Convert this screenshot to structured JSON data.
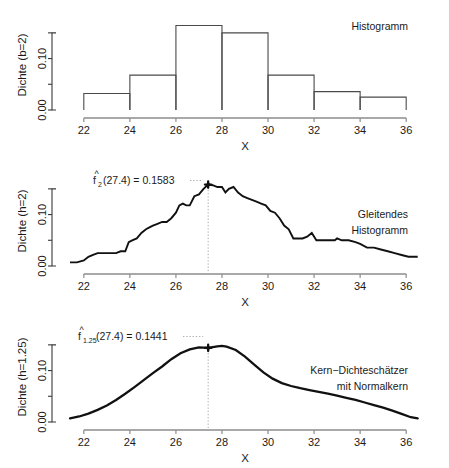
{
  "figure": {
    "background": "#ffffff",
    "ink": "#111111",
    "axis_color": "#3a3a3a",
    "guide_color": "#9a9a9a"
  },
  "chart_data": [
    {
      "id": "histogramm",
      "type": "bar",
      "title": "Histogramm",
      "xlabel": "X",
      "ylabel": "Dichte (b=2)",
      "xlim": [
        21.4,
        36.6
      ],
      "ylim": [
        0.0,
        0.175
      ],
      "xticks": [
        22,
        24,
        26,
        28,
        30,
        32,
        34,
        36
      ],
      "xticklabels": [
        "22",
        "24",
        "26",
        "28",
        "30",
        "32",
        "34",
        "36"
      ],
      "yticks": [
        0.0,
        0.05,
        0.1,
        0.15
      ],
      "yticklabels": [
        "0.00",
        "",
        "0.10",
        ""
      ],
      "grid": false,
      "binwidth": 2,
      "bin_edges": [
        22,
        24,
        26,
        28,
        30,
        32,
        34,
        36
      ],
      "categories": [
        "22-24",
        "24-26",
        "26-28",
        "28-30",
        "30-32",
        "32-34",
        "34-36"
      ],
      "values": [
        0.0321,
        0.0679,
        0.1643,
        0.15,
        0.0679,
        0.0357,
        0.025
      ]
    },
    {
      "id": "gleitendes-histogramm",
      "type": "line",
      "title_line1": "Gleitendes",
      "title_line2": "Histogramm",
      "xlabel": "X",
      "ylabel": "Dichte (h=2)",
      "xlim": [
        21.4,
        36.6
      ],
      "ylim": [
        0.0,
        0.175
      ],
      "xticks": [
        22,
        24,
        26,
        28,
        30,
        32,
        34,
        36
      ],
      "xticklabels": [
        "22",
        "24",
        "26",
        "28",
        "30",
        "32",
        "34",
        "36"
      ],
      "yticks": [
        0.0,
        0.05,
        0.1,
        0.15
      ],
      "yticklabels": [
        "0.00",
        "",
        "0.10",
        ""
      ],
      "grid": false,
      "annotation": {
        "fhat": "f",
        "hat": "^",
        "subscript": "2",
        "text": "(27.4) = 0.1583",
        "point_x": 27.4,
        "point_y": 0.1583
      },
      "x": [
        21.4,
        21.7,
        22.0,
        22.2,
        22.4,
        22.6,
        22.8,
        23.0,
        23.2,
        23.4,
        23.6,
        23.8,
        23.95,
        24.1,
        24.3,
        24.5,
        24.7,
        24.85,
        25.0,
        25.2,
        25.4,
        25.6,
        25.8,
        26.0,
        26.15,
        26.3,
        26.45,
        26.6,
        26.8,
        27.0,
        27.2,
        27.4,
        27.6,
        27.8,
        28.0,
        28.15,
        28.3,
        28.5,
        28.7,
        28.9,
        29.1,
        29.3,
        29.5,
        29.7,
        29.9,
        30.1,
        30.3,
        30.5,
        30.7,
        30.9,
        31.1,
        31.3,
        31.5,
        31.7,
        31.9,
        32.1,
        32.3,
        32.6,
        32.9,
        33.0,
        33.2,
        33.5,
        33.8,
        34.0,
        34.3,
        34.6,
        34.9,
        35.2,
        35.5,
        35.8,
        36.1,
        36.5
      ],
      "y": [
        0.0071,
        0.0071,
        0.0107,
        0.0179,
        0.0214,
        0.025,
        0.025,
        0.025,
        0.025,
        0.025,
        0.0286,
        0.0286,
        0.0464,
        0.05,
        0.0536,
        0.0643,
        0.0714,
        0.075,
        0.0786,
        0.0821,
        0.0857,
        0.0857,
        0.0929,
        0.1036,
        0.1179,
        0.1214,
        0.1179,
        0.1179,
        0.1357,
        0.1393,
        0.15,
        0.1583,
        0.1571,
        0.1536,
        0.1536,
        0.1429,
        0.15,
        0.1536,
        0.1429,
        0.1357,
        0.1321,
        0.1286,
        0.125,
        0.1214,
        0.1179,
        0.1071,
        0.1036,
        0.0929,
        0.0786,
        0.0714,
        0.0536,
        0.0536,
        0.0536,
        0.0571,
        0.0643,
        0.05,
        0.05,
        0.05,
        0.05,
        0.0536,
        0.05,
        0.05,
        0.0464,
        0.0429,
        0.0357,
        0.0357,
        0.0321,
        0.0286,
        0.025,
        0.0214,
        0.0179,
        0.0179
      ]
    },
    {
      "id": "kern-dichteschaetzer",
      "type": "line",
      "title_line1": "Kern−Dichteschätzer",
      "title_line2": "mit Normalkern",
      "xlabel": "X",
      "ylabel": "Dichte (h=1.25)",
      "xlim": [
        21.4,
        36.6
      ],
      "ylim": [
        0.0,
        0.175
      ],
      "xticks": [
        22,
        24,
        26,
        28,
        30,
        32,
        34,
        36
      ],
      "xticklabels": [
        "22",
        "24",
        "26",
        "28",
        "30",
        "32",
        "34",
        "36"
      ],
      "yticks": [
        0.0,
        0.05,
        0.1,
        0.15
      ],
      "yticklabels": [
        "0.00",
        "",
        "0.10",
        ""
      ],
      "grid": false,
      "annotation": {
        "fhat": "f",
        "hat": "^",
        "subscript": "1.25",
        "text": "(27.4) = 0.1441",
        "point_x": 27.4,
        "point_y": 0.1441
      },
      "x": [
        21.4,
        21.8,
        22.2,
        22.6,
        23.0,
        23.4,
        23.8,
        24.2,
        24.6,
        25.0,
        25.4,
        25.8,
        26.2,
        26.6,
        27.0,
        27.4,
        27.8,
        28.0,
        28.2,
        28.6,
        29.0,
        29.4,
        29.8,
        30.2,
        30.6,
        31.0,
        31.4,
        31.8,
        32.2,
        32.6,
        33.0,
        33.4,
        33.8,
        34.2,
        34.6,
        35.0,
        35.4,
        35.8,
        36.2,
        36.5
      ],
      "y": [
        0.0071,
        0.0107,
        0.0164,
        0.0236,
        0.0321,
        0.0429,
        0.055,
        0.0679,
        0.0814,
        0.095,
        0.1079,
        0.1221,
        0.1336,
        0.1411,
        0.145,
        0.1441,
        0.1471,
        0.1479,
        0.1464,
        0.14,
        0.1271,
        0.1114,
        0.0964,
        0.0843,
        0.0757,
        0.07,
        0.0657,
        0.0621,
        0.0586,
        0.055,
        0.0514,
        0.0471,
        0.0429,
        0.0379,
        0.0329,
        0.0279,
        0.0221,
        0.0157,
        0.0093,
        0.0071
      ]
    }
  ]
}
